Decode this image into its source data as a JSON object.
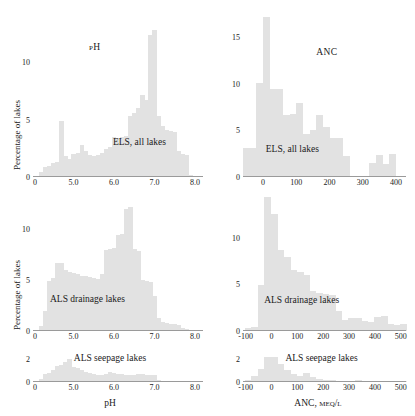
{
  "figure": {
    "axis_label_y": "Percentage of lakes",
    "xlabel_left": "pH",
    "xlabel_right": "ANC, μeq/l",
    "bar_color": "#e2e2e2",
    "axis_color": "#9a9a9a"
  },
  "chart_data": [
    {
      "id": "ph-els-all-lakes",
      "type": "bar",
      "title": "pH",
      "note": "ELS, all lakes",
      "xlabel": "",
      "ylabel": "Percentage of lakes",
      "xlim": [
        4.0,
        8.2
      ],
      "ylim": [
        0,
        13.5
      ],
      "xticks": [
        0,
        5.0,
        6.0,
        7.0,
        8.0
      ],
      "xticklabels": [
        "0",
        "5.0",
        "6.0",
        "7.0",
        "8.0"
      ],
      "yticks": [
        0,
        5,
        10
      ],
      "yticklabels": [
        "0",
        "5",
        "10"
      ],
      "grid": false,
      "bin_width": 0.1,
      "x": [
        4.2,
        4.3,
        4.4,
        4.5,
        4.6,
        4.7,
        4.8,
        4.9,
        5.0,
        5.1,
        5.2,
        5.3,
        5.4,
        5.5,
        5.6,
        5.7,
        5.8,
        5.9,
        6.0,
        6.1,
        6.2,
        6.3,
        6.4,
        6.5,
        6.6,
        6.7,
        6.8,
        6.9,
        7.0,
        7.1,
        7.2,
        7.3,
        7.4,
        7.5,
        7.6,
        7.7,
        7.8,
        7.9
      ],
      "values": [
        0.4,
        0.9,
        1.0,
        1.2,
        1.3,
        4.9,
        1.8,
        1.6,
        2.0,
        2.1,
        2.8,
        2.3,
        1.9,
        1.8,
        1.9,
        2.1,
        2.4,
        2.6,
        3.5,
        3.4,
        3.5,
        3.6,
        5.3,
        5.6,
        6.0,
        7.1,
        6.7,
        12.4,
        12.8,
        5.3,
        4.4,
        4.1,
        4.0,
        3.9,
        2.3,
        2.0,
        1.9,
        0.2
      ]
    },
    {
      "id": "anc-els-all-lakes",
      "type": "bar",
      "title": "ANC",
      "note": "ELS, all lakes",
      "xlabel": "",
      "ylabel": "",
      "xlim": [
        -60,
        430
      ],
      "ylim": [
        0,
        17.5
      ],
      "xticks": [
        0,
        100,
        200,
        300,
        400
      ],
      "xticklabels": [
        "0",
        "100",
        "200",
        "300",
        "400"
      ],
      "yticks": [
        0,
        5,
        10,
        15
      ],
      "yticklabels": [
        "0",
        "5",
        "10",
        "15"
      ],
      "grid": false,
      "bin_width": 20,
      "x": [
        -50,
        -30,
        -10,
        10,
        30,
        50,
        70,
        90,
        110,
        130,
        150,
        170,
        190,
        210,
        230,
        250,
        270,
        290,
        310,
        330,
        350,
        370,
        390
      ],
      "values": [
        3.1,
        3.1,
        10.1,
        17.2,
        9.4,
        9.5,
        6.7,
        6.8,
        8.0,
        4.6,
        5.0,
        6.7,
        5.4,
        4.2,
        4.2,
        2.3,
        0.1,
        0.1,
        0.1,
        1.5,
        2.4,
        1.4,
        2.5
      ]
    },
    {
      "id": "ph-als-drainage-lakes",
      "type": "bar",
      "title": "",
      "note": "ALS drainage lakes",
      "xlabel": "",
      "ylabel": "Percentage of lakes",
      "xlim": [
        4.0,
        8.2
      ],
      "ylim": [
        0,
        12.5
      ],
      "xticks": [
        0,
        5.0,
        6.0,
        7.0,
        8.0
      ],
      "xticklabels": [
        "0",
        "5.0",
        "6.0",
        "7.0",
        "8.0"
      ],
      "yticks": [
        0,
        5,
        10
      ],
      "yticklabels": [
        "0",
        "5",
        "10"
      ],
      "grid": false,
      "bin_width": 0.1,
      "x": [
        4.2,
        4.3,
        4.4,
        4.5,
        4.6,
        4.7,
        4.8,
        4.9,
        5.0,
        5.1,
        5.2,
        5.3,
        5.4,
        5.5,
        5.6,
        5.7,
        5.8,
        5.9,
        6.0,
        6.1,
        6.2,
        6.3,
        6.4,
        6.5,
        6.6,
        6.7,
        6.8,
        6.9,
        7.0,
        7.1,
        7.2,
        7.3,
        7.4,
        7.5,
        7.6,
        7.7,
        7.8,
        7.9
      ],
      "values": [
        0.5,
        2.0,
        4.9,
        5.2,
        6.6,
        6.6,
        6.0,
        5.8,
        5.7,
        5.6,
        5.4,
        5.4,
        5.3,
        5.2,
        5.1,
        5.6,
        7.9,
        8.0,
        8.1,
        9.4,
        9.5,
        11.9,
        12.1,
        8.0,
        7.8,
        5.0,
        4.9,
        4.8,
        3.4,
        1.3,
        0.9,
        0.8,
        0.7,
        0.7,
        0.6,
        0.3,
        0.2,
        0.1
      ]
    },
    {
      "id": "anc-als-drainage-lakes",
      "type": "bar",
      "title": "",
      "note": "ALS drainage lakes",
      "xlabel": "",
      "ylabel": "",
      "xlim": [
        -110,
        520
      ],
      "ylim": [
        0,
        14.5
      ],
      "xticks": [
        -100,
        0,
        100,
        200,
        300,
        400,
        500
      ],
      "xticklabels": [
        "-100",
        "0",
        "100",
        "200",
        "300",
        "400",
        "500"
      ],
      "yticks": [
        0,
        5,
        10
      ],
      "yticklabels": [
        "0",
        "5",
        "10"
      ],
      "grid": false,
      "bin_width": 25,
      "x": [
        -90,
        -65,
        -40,
        -15,
        10,
        35,
        60,
        85,
        110,
        135,
        160,
        185,
        210,
        235,
        260,
        285,
        310,
        335,
        360,
        385,
        410,
        435,
        460,
        485,
        510
      ],
      "values": [
        0.3,
        0.4,
        4.9,
        14.4,
        12.6,
        8.7,
        8.0,
        6.5,
        6.3,
        6.0,
        4.3,
        4.1,
        4.0,
        3.9,
        2.1,
        1.2,
        1.4,
        1.4,
        1.1,
        1.0,
        1.5,
        1.6,
        0.8,
        0.6,
        0.8
      ]
    },
    {
      "id": "ph-als-seepage-lakes",
      "type": "bar",
      "title": "",
      "note": "ALS seepage lakes",
      "xlabel": "pH",
      "ylabel": "",
      "xlim": [
        4.0,
        8.2
      ],
      "ylim": [
        0,
        2.6
      ],
      "xticks": [
        0,
        5.0,
        6.0,
        7.0,
        8.0
      ],
      "xticklabels": [
        "0",
        "5.0",
        "6.0",
        "7.0",
        "8.0"
      ],
      "yticks": [
        0,
        2
      ],
      "yticklabels": [
        "0",
        "2"
      ],
      "grid": false,
      "bin_width": 0.1,
      "x": [
        4.2,
        4.3,
        4.4,
        4.5,
        4.6,
        4.7,
        4.8,
        4.9,
        5.0,
        5.1,
        5.2,
        5.3,
        5.4,
        5.5,
        5.6,
        5.7,
        5.8,
        5.9,
        6.0,
        6.1,
        6.2,
        6.3,
        6.4,
        6.5,
        6.6,
        6.7,
        6.8,
        6.9,
        7.0,
        7.1,
        7.2,
        7.3,
        7.4,
        7.5,
        7.6,
        7.7,
        7.8,
        7.9
      ],
      "values": [
        0.3,
        0.7,
        0.8,
        1.0,
        1.4,
        1.5,
        1.7,
        2.0,
        1.3,
        1.2,
        1.0,
        0.9,
        0.8,
        0.7,
        0.6,
        0.6,
        0.7,
        0.9,
        0.8,
        0.7,
        0.7,
        0.6,
        0.6,
        0.6,
        0.7,
        0.7,
        0.6,
        0.6,
        0.6,
        0.2,
        0.1,
        0.1,
        0.05,
        0.05,
        0.05,
        0.05,
        0.0,
        0.0
      ]
    },
    {
      "id": "anc-als-seepage-lakes",
      "type": "bar",
      "title": "",
      "note": "ALS seepage lakes",
      "xlabel": "ANC, μeq/l",
      "ylabel": "",
      "xlim": [
        -110,
        520
      ],
      "ylim": [
        0,
        2.6
      ],
      "xticks": [
        -100,
        0,
        100,
        200,
        300,
        400,
        500
      ],
      "xticklabels": [
        "-100",
        "0",
        "100",
        "200",
        "300",
        "400",
        "500"
      ],
      "yticks": [
        0,
        2
      ],
      "yticklabels": [
        "0",
        "2"
      ],
      "grid": false,
      "bin_width": 25,
      "x": [
        -90,
        -65,
        -40,
        -15,
        10,
        35,
        60,
        85,
        110,
        135,
        160,
        185,
        210,
        235,
        260,
        285,
        310,
        335,
        360,
        385,
        410,
        435,
        460,
        485,
        510
      ],
      "values": [
        0.2,
        0.5,
        1.1,
        2.2,
        2.2,
        1.6,
        1.0,
        0.7,
        0.5,
        0.8,
        0.4,
        0.3,
        0.2,
        0.2,
        0.1,
        0.1,
        0.1,
        0.15,
        0.1,
        0.1,
        0.1,
        0.1,
        0.05,
        0.05,
        0.05
      ]
    }
  ],
  "panels": [
    {
      "title_pos": {
        "left": 0.33,
        "top": 0.13
      },
      "note_pos": {
        "left": 0.47,
        "top": 0.74
      }
    },
    {
      "title_pos": {
        "left": 0.45,
        "top": 0.2
      },
      "note_pos": {
        "left": 0.14,
        "top": 0.8
      }
    },
    {
      "title_pos": {
        "left": 0.0,
        "top": 0.0
      },
      "note_pos": {
        "left": 0.1,
        "top": 0.71
      }
    },
    {
      "title_pos": {
        "left": 0.0,
        "top": 0.0
      },
      "note_pos": {
        "left": 0.13,
        "top": 0.73
      }
    },
    {
      "title_pos": {
        "left": 0.0,
        "top": 0.0
      },
      "note_pos": {
        "left": 0.24,
        "top": 0.02
      }
    },
    {
      "title_pos": {
        "left": 0.0,
        "top": 0.0
      },
      "note_pos": {
        "left": 0.26,
        "top": 0.02
      }
    }
  ]
}
